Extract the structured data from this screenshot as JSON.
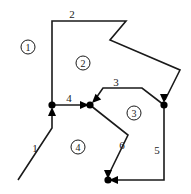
{
  "figure": {
    "type": "directed-polygon-subdivision-diagram",
    "width": 191,
    "height": 194,
    "background_color": "#ffffff",
    "stroke_color": "#1a1a1a",
    "node_color": "#000000"
  },
  "nodes": [
    {
      "id": "n1",
      "name": "left-junction-node",
      "x": 52,
      "y": 105
    },
    {
      "id": "n2",
      "name": "center-junction-node",
      "x": 90,
      "y": 105
    },
    {
      "id": "n3",
      "name": "right-junction-node",
      "x": 164,
      "y": 105
    },
    {
      "id": "n4",
      "name": "bottom-junction-node",
      "x": 108,
      "y": 180
    },
    {
      "id": "n5",
      "name": "bottom-left-corner-node",
      "x": 18,
      "y": 180
    }
  ],
  "edges": [
    {
      "id": "e1",
      "label": "1",
      "label_x": 35,
      "label_y": 148,
      "path": "M 18 180 L 52 128 L 52 110",
      "arrow": {
        "x": 52,
        "y": 107,
        "direction": "up"
      }
    },
    {
      "id": "e2",
      "label": "2",
      "label_x": 72,
      "label_y": 14,
      "path": "M 52 105 L 52 21 L 126 21 L 110 40 L 180 70 L 165 100",
      "arrow": {
        "x": 164,
        "y": 103,
        "direction": "down"
      }
    },
    {
      "id": "e3",
      "label": "3",
      "label_x": 116,
      "label_y": 82,
      "path": "M 164 105 L 142 88 L 103 88 L 94 101",
      "arrow": {
        "x": 92,
        "y": 103,
        "direction": "down-left"
      }
    },
    {
      "id": "e4",
      "label": "4",
      "label_x": 69,
      "label_y": 98,
      "path": "M 52 105 L 86 105",
      "arrow": {
        "x": 89,
        "y": 105,
        "direction": "right"
      }
    },
    {
      "id": "e5",
      "label": "5",
      "label_x": 157,
      "label_y": 150,
      "path": "M 164 105 L 164 180 L 112 180",
      "arrow": {
        "x": 109,
        "y": 180,
        "direction": "left"
      }
    },
    {
      "id": "e6",
      "label": "6",
      "label_x": 122,
      "label_y": 145,
      "path": "M 90 105 L 128 135 L 108 176",
      "arrow": {
        "x": 108,
        "y": 179,
        "direction": "down"
      }
    }
  ],
  "regions": [
    {
      "id": "r1",
      "label": "1",
      "x": 28,
      "y": 47
    },
    {
      "id": "r2",
      "label": "2",
      "x": 83,
      "y": 63
    },
    {
      "id": "r3",
      "label": "3",
      "x": 134,
      "y": 113
    },
    {
      "id": "r4",
      "label": "4",
      "x": 78,
      "y": 147
    }
  ]
}
